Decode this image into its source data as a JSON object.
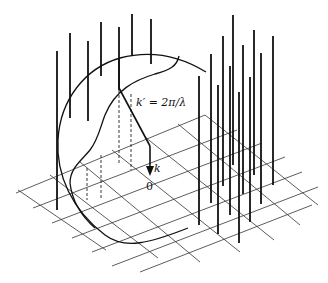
{
  "figure": {
    "labels": {
      "k_prime": "k′ = 2π/λ",
      "k": "k",
      "origin": "0"
    },
    "colors": {
      "line": "#111111",
      "background": "#ffffff"
    }
  }
}
